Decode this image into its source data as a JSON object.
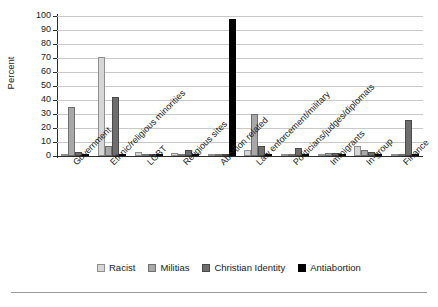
{
  "chart_data": {
    "type": "bar",
    "title": "",
    "xlabel": "",
    "ylabel": "Percent",
    "ylim": [
      0,
      100
    ],
    "yticks": [
      0,
      10,
      20,
      30,
      40,
      50,
      60,
      70,
      80,
      90,
      100
    ],
    "grid": true,
    "legend_position": "bottom",
    "categories": [
      "Government",
      "Ethnic/religious minorities",
      "LGBT",
      "Religious sites",
      "Abortion related",
      "Law enforcement/military",
      "Politicians/judges/diplomats",
      "Immigrants",
      "In-group",
      "Finance"
    ],
    "series": [
      {
        "name": "Racist",
        "color": "#d6d6d6",
        "values": [
          1,
          71,
          3,
          2,
          0.5,
          4,
          1,
          0.5,
          7,
          0.5
        ]
      },
      {
        "name": "Militias",
        "color": "#a8a8a8",
        "values": [
          35,
          7,
          1,
          1.5,
          0.5,
          30,
          0.5,
          2.5,
          4,
          1.5
        ]
      },
      {
        "name": "Christian Identity",
        "color": "#6e6e6e",
        "values": [
          3,
          42,
          1.5,
          4.5,
          1.5,
          7.5,
          5.5,
          2.5,
          3,
          26
        ]
      },
      {
        "name": "Antiabortion",
        "color": "#000000",
        "values": [
          0,
          0,
          0,
          0.5,
          98,
          0,
          0,
          0,
          0,
          1
        ]
      }
    ]
  },
  "legend": {
    "items": [
      {
        "label": "Racist"
      },
      {
        "label": "Militias"
      },
      {
        "label": "Christian Identity"
      },
      {
        "label": "Antiabortion"
      }
    ]
  },
  "axes": {
    "y_title": "Percent",
    "y_tick_labels": [
      "100",
      "90",
      "80",
      "70",
      "60",
      "50",
      "40",
      "30",
      "20",
      "10",
      "0"
    ]
  }
}
